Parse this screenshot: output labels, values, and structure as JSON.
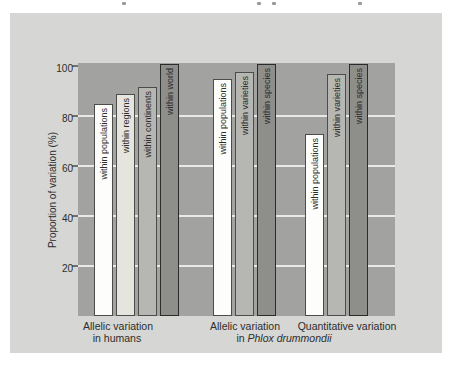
{
  "colors": {
    "panel_background": "#d6d6d4",
    "plot_background": "#a2a2a0",
    "gridline": "#e9e9e7",
    "text": "#2d2d2b",
    "bar_white": "#fdfdfc",
    "bar_light": "#e5e4dd",
    "bar_medium": "#b6b6b2",
    "bar_dark": "#8e8e8b"
  },
  "chart_data": {
    "type": "bar",
    "title": "",
    "ylabel": "Proportion of variation (%)",
    "xlabel": "",
    "ylim": [
      0,
      100
    ],
    "yticks": [
      20,
      40,
      60,
      80,
      100
    ],
    "gridlines": [
      20,
      40,
      60,
      80
    ],
    "grid": "horizontal light lines at 20/40/60/80, behind bars",
    "legend_position": "none",
    "axis_labels": {
      "group1_line1": "Allelic variation",
      "group1_line2": "in humans",
      "group2_line1": "Allelic variation",
      "group3_line1": "Quantitative variation",
      "shared_line2_prefix": "in ",
      "shared_line2_italic": "Phlox drummondii"
    },
    "groups": [
      {
        "name": "Allelic variation in humans",
        "bars": [
          {
            "label": "within populations",
            "value": 84,
            "style": "white"
          },
          {
            "label": "within regions",
            "value": 88,
            "style": "light"
          },
          {
            "label": "within continents",
            "value": 91,
            "style": "medium"
          },
          {
            "label": "within world",
            "value": 100,
            "style": "dark"
          }
        ]
      },
      {
        "name": "Allelic variation in Phlox drummondii",
        "bars": [
          {
            "label": "within populations",
            "value": 94,
            "style": "white"
          },
          {
            "label": "within varieties",
            "value": 97,
            "style": "medium"
          },
          {
            "label": "within species",
            "value": 100,
            "style": "dark"
          }
        ]
      },
      {
        "name": "Quantitative variation in Phlox drummondii",
        "bars": [
          {
            "label": "within populations",
            "value": 72,
            "style": "white"
          },
          {
            "label": "within varieties",
            "value": 96,
            "style": "medium"
          },
          {
            "label": "within species",
            "value": 100,
            "style": "dark"
          }
        ]
      }
    ]
  }
}
